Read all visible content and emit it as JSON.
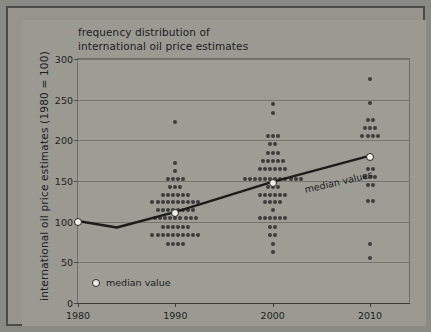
{
  "chart_data": {
    "type": "scatter",
    "title": "frequency distribution of international oil price estimates",
    "title_lines": [
      "frequency distribution of",
      "international oil price estimates"
    ],
    "xlabel": "",
    "ylabel": "international oil price estimates (1980 = 100)",
    "xlim": [
      1980,
      2014
    ],
    "ylim": [
      0,
      300
    ],
    "x_ticks": [
      1980,
      1990,
      2000,
      2010
    ],
    "x_tick_labels": [
      "1980",
      "1990",
      "2000",
      "2010"
    ],
    "y_ticks": [
      0,
      50,
      100,
      150,
      200,
      250,
      300
    ],
    "y_tick_labels": [
      "0",
      "50",
      "100",
      "150",
      "200",
      "250",
      "300"
    ],
    "grid": true,
    "legend_position": "inside-lower-left",
    "legend_entries": [
      "median value"
    ],
    "annotations": [
      "median values"
    ],
    "series": [
      {
        "name": "median values",
        "type": "line",
        "x": [
          1980,
          1984,
          1990,
          2000,
          2010
        ],
        "values": [
          100,
          92,
          111,
          148,
          180
        ],
        "markers_at": [
          1980,
          1990,
          2000,
          2010
        ],
        "marker_values": [
          100,
          111,
          148,
          180
        ]
      },
      {
        "name": "frequency distribution of estimates",
        "type": "dot-histogram",
        "groups": [
          {
            "year": 1990,
            "rows": [
              {
                "value": 222,
                "count": 1
              },
              {
                "value": 172,
                "count": 1
              },
              {
                "value": 162,
                "count": 1
              },
              {
                "value": 152,
                "count": 4
              },
              {
                "value": 143,
                "count": 3
              },
              {
                "value": 133,
                "count": 6
              },
              {
                "value": 124,
                "count": 10
              },
              {
                "value": 114,
                "count": 8
              },
              {
                "value": 104,
                "count": 9
              },
              {
                "value": 93,
                "count": 6
              },
              {
                "value": 84,
                "count": 10
              },
              {
                "value": 72,
                "count": 4
              }
            ]
          },
          {
            "year": 2000,
            "rows": [
              {
                "value": 245,
                "count": 1
              },
              {
                "value": 234,
                "count": 1
              },
              {
                "value": 205,
                "count": 3
              },
              {
                "value": 195,
                "count": 2
              },
              {
                "value": 185,
                "count": 3
              },
              {
                "value": 175,
                "count": 5
              },
              {
                "value": 165,
                "count": 6
              },
              {
                "value": 152,
                "count": 12
              },
              {
                "value": 143,
                "count": 3
              },
              {
                "value": 133,
                "count": 6
              },
              {
                "value": 124,
                "count": 4
              },
              {
                "value": 114,
                "count": 1
              },
              {
                "value": 104,
                "count": 6
              },
              {
                "value": 93,
                "count": 2
              },
              {
                "value": 84,
                "count": 2
              },
              {
                "value": 72,
                "count": 1
              },
              {
                "value": 63,
                "count": 1
              }
            ]
          },
          {
            "year": 2010,
            "rows": [
              {
                "value": 275,
                "count": 1
              },
              {
                "value": 246,
                "count": 1
              },
              {
                "value": 225,
                "count": 2
              },
              {
                "value": 215,
                "count": 3
              },
              {
                "value": 205,
                "count": 4
              },
              {
                "value": 165,
                "count": 2
              },
              {
                "value": 155,
                "count": 3
              },
              {
                "value": 145,
                "count": 2
              },
              {
                "value": 125,
                "count": 2
              },
              {
                "value": 73,
                "count": 1
              },
              {
                "value": 55,
                "count": 1
              }
            ]
          }
        ]
      }
    ],
    "colors": {
      "background": "#9a9a93",
      "frame": "#4a4a48",
      "dot": "#3c3c3a",
      "median_line": "#1c1c1a",
      "median_marker_fill": "#efefe6",
      "gridline": "#76766f",
      "text": "#1e1e1d"
    }
  }
}
